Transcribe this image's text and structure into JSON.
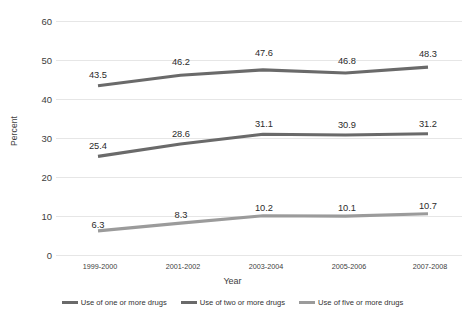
{
  "chart_data": {
    "type": "line",
    "title": "",
    "xlabel": "Year",
    "ylabel": "Percent",
    "categories": [
      "1999-2000",
      "2001-2002",
      "2003-2004",
      "2005-2006",
      "2007-2008"
    ],
    "yticks": [
      0,
      10,
      20,
      30,
      40,
      50,
      60
    ],
    "ylim": [
      0,
      62
    ],
    "grid": "horizontal",
    "legend_position": "bottom",
    "series": [
      {
        "name": "Use of one or more drugs",
        "color": "#6a6a6a",
        "values": [
          43.5,
          46.2,
          47.6,
          46.8,
          48.3
        ],
        "labels": [
          "43.5",
          "46.2",
          "47.6",
          "46.8",
          "48.3"
        ]
      },
      {
        "name": "Use of two or more drugs",
        "color": "#6a6a6a",
        "values": [
          25.4,
          28.6,
          31.1,
          30.9,
          31.2
        ],
        "labels": [
          "25.4",
          "28.6",
          "31.1",
          "30.9",
          "31.2"
        ]
      },
      {
        "name": "Use of five or more drugs",
        "color": "#9b9b9b",
        "values": [
          6.3,
          8.3,
          10.2,
          10.1,
          10.7
        ],
        "labels": [
          "6.3",
          "8.3",
          "10.2",
          "10.1",
          "10.7"
        ]
      }
    ]
  },
  "axis": {
    "y_title": "Percent",
    "x_title": "Year",
    "yticks": [
      "60",
      "50",
      "40",
      "30",
      "20",
      "10",
      "0"
    ],
    "xticks": [
      "1999-2000",
      "2001-2002",
      "2003-2004",
      "2005-2006",
      "2007-2008"
    ]
  },
  "legend": {
    "items": [
      {
        "label": "Use of one or more drugs"
      },
      {
        "label": "Use of two or more drugs"
      },
      {
        "label": "Use of five or more drugs"
      }
    ]
  }
}
